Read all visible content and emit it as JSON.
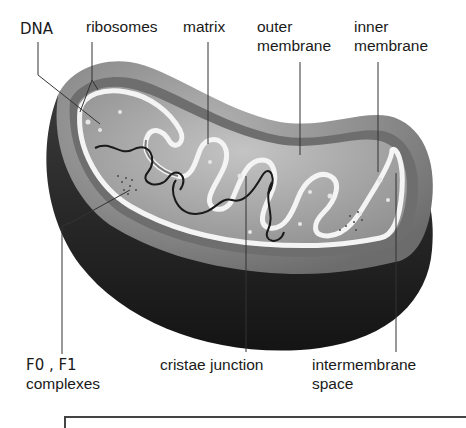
{
  "diagram": {
    "labels": {
      "dna": "DNA",
      "ribosomes": "ribosomes",
      "matrix": "matrix",
      "outer_membrane_1": "outer",
      "outer_membrane_2": "membrane",
      "inner_membrane_1": "inner",
      "inner_membrane_2": "membrane",
      "f0f1_1": "F0 , F1",
      "f0f1_2": "complexes",
      "cristae_junction": "cristae junction",
      "intermembrane_1": "intermembrane",
      "intermembrane_2": "space"
    },
    "colors": {
      "outer_shell": "#8a8a8a",
      "dark_body": "#1e1e1e",
      "inner_membrane": "#f2f2f2",
      "matrix_fill": "#a6a6a6",
      "leader_line": "#333333",
      "text": "#1a1a1a"
    }
  }
}
